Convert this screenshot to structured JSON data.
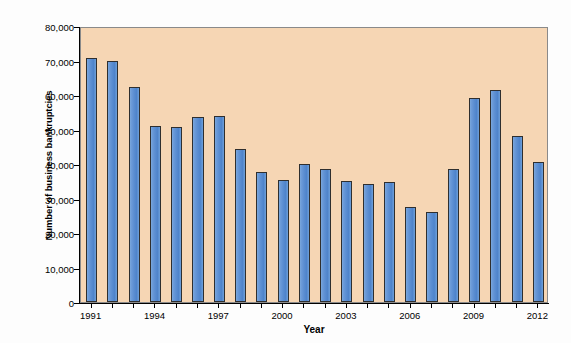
{
  "chart_data": {
    "type": "bar",
    "title": "",
    "xlabel": "Year",
    "ylabel": "Number of business bankruptcies",
    "grid": false,
    "legend": "none",
    "ylim": [
      0,
      80000
    ],
    "ytick_values": [
      0,
      10000,
      20000,
      30000,
      40000,
      50000,
      60000,
      70000,
      80000
    ],
    "ytick_labels": [
      "0",
      "10,000",
      "20,000",
      "30,000",
      "40,000",
      "50,000",
      "60,000",
      "70,000",
      "80,000"
    ],
    "xtick_labels": [
      "1991",
      "1994",
      "1997",
      "2000",
      "2003",
      "2006",
      "2009",
      "2012"
    ],
    "categories": [
      "1991",
      "1992",
      "1993",
      "1994",
      "1995",
      "1996",
      "1997",
      "1998",
      "1999",
      "2000",
      "2001",
      "2002",
      "2003",
      "2004",
      "2005",
      "2006",
      "2007",
      "2008",
      "2009",
      "2010",
      "2011",
      "2012"
    ],
    "values": [
      70600,
      70000,
      62300,
      50900,
      50600,
      53500,
      54000,
      44400,
      37600,
      35500,
      40100,
      38500,
      35000,
      34300,
      34900,
      27500,
      26200,
      38700,
      59000,
      61500,
      48000,
      40500
    ],
    "colors": {
      "bar_fill": "#5B8ED2",
      "bar_edge": "#2F2F2F",
      "plot_background": "#F6D6B4",
      "figure_background": "#FDFDFD",
      "axis": "#000000"
    }
  }
}
